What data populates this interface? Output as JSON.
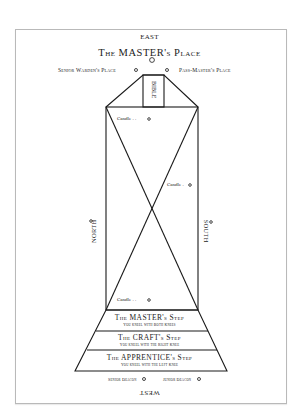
{
  "compass": {
    "east": "EAST",
    "west": "WEST",
    "north": "NORTH",
    "south": "SOUTH"
  },
  "places": {
    "master": "The MASTER's Place",
    "senior_warden": "Senior Warden's Place",
    "past_master": "Pass-Master's Place"
  },
  "altar": {
    "bible": "BIBLE"
  },
  "candles": [
    {
      "label": "Candle . ."
    },
    {
      "label": "Candle ."
    },
    {
      "label": "Candle . ."
    }
  ],
  "steps": [
    {
      "title": "The MASTER's Step",
      "subtitle": "You kneel with Both Knees"
    },
    {
      "title": "The CRAFT's Step",
      "subtitle": "You kneel with the Right Knee"
    },
    {
      "title": "The APPRENTICE's Step",
      "subtitle": "You kneel with the Left Knee"
    }
  ],
  "deacons": {
    "senior": "Senior Deacon",
    "junior": "Junior Deacon"
  },
  "colors": {
    "line": "#1a1a1a",
    "frame": "#b9b9b9",
    "background": "#ffffff"
  }
}
